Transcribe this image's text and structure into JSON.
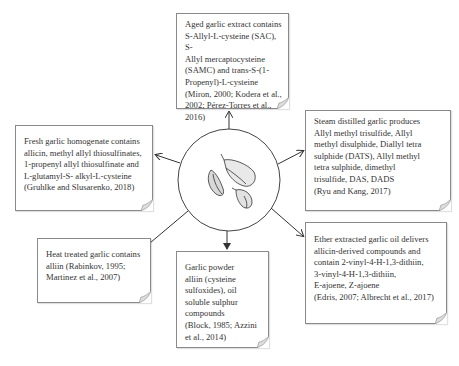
{
  "diagram": {
    "center": {
      "label": "",
      "icon": "garlic-bulbs-illustration"
    },
    "boxes": {
      "top": {
        "text": "Aged garlic extract contains\nS-Allyl-L-cysteine (SAC), S-\nAllyl mercaptocysteine\n(SAMC) and trans-S-(1-\nPropenyl)-L-cysteine\n(Miron, 2000; Kodera et al.,\n2002; Pérez-Torres et al., 2016)"
      },
      "left": {
        "text": "Fresh garlic homogenate contains\nallicin, methyl allyl thiosulfinates,\n1-propenyl allyl thiosulfinate and\nL-glutamyl-S- alkyl-L-cysteine\n(Gruhlke and Slusarenko, 2018)"
      },
      "right": {
        "text": "Steam distilled garlic produces\nAllyl methyl trisulfide, Allyl\nmethyl disulphide, Diallyl tetra\nsulphide (DATS), Allyl methyl\ntetra sulphide, dimethyl\ntrisulfide, DAS, DADS\n(Ryu and Kang, 2017)"
      },
      "bottom_left": {
        "text": "Heat treated garlic contains\nalliin (Rabinkov, 1995;\nMartinez et al., 2007)"
      },
      "bottom": {
        "text": "Garlic powder\nalliin (cysteine\nsulfoxides), oil\nsoluble sulphur\ncompounds\n(Block, 1985; Azzini\net al., 2014)"
      },
      "bottom_right": {
        "text": "Ether extracted garlic oil delivers\nallicin-derived compounds and\ncontain 2-vinyl-4-H-1,3-dithiin,\n3-vinyl-4-H-1,3-dithiin,\nE-ajoene, Z-ajoene\n(Edris, 2007; Albrecht et al., 2017)"
      }
    },
    "colors": {
      "line": "#333333",
      "border": "#8a8a8a",
      "text": "#333333"
    }
  }
}
